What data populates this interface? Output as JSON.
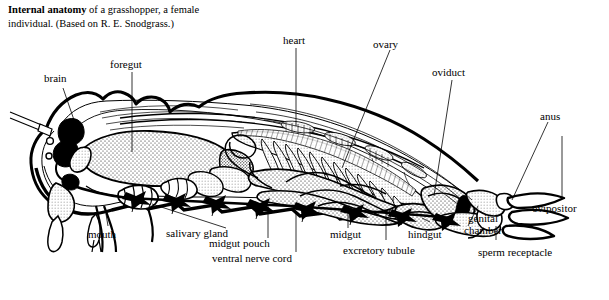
{
  "figure": {
    "caption_bold": "Internal anatomy",
    "caption_rest": " of a grasshopper, a female individual. (Based on R. E. Snodgrass.)",
    "background_color": "#ffffff",
    "ink_color": "#000000"
  },
  "labels": [
    {
      "id": "brain",
      "text": "brain"
    },
    {
      "id": "foregut",
      "text": "foregut"
    },
    {
      "id": "heart",
      "text": "heart"
    },
    {
      "id": "ovary",
      "text": "ovary"
    },
    {
      "id": "oviduct",
      "text": "oviduct"
    },
    {
      "id": "anus",
      "text": "anus"
    },
    {
      "id": "ovipositor",
      "text": "ovipositor"
    },
    {
      "id": "genital_chamber",
      "text": "genital chamber"
    },
    {
      "id": "sperm_receptacle",
      "text": "sperm receptacle"
    },
    {
      "id": "hindgut",
      "text": "hindgut"
    },
    {
      "id": "excretory_tubule",
      "text": "excretory tubule"
    },
    {
      "id": "midgut",
      "text": "midgut"
    },
    {
      "id": "ventral_nerve_cord",
      "text": "ventral nerve cord"
    },
    {
      "id": "midgut_pouch",
      "text": "midgut pouch"
    },
    {
      "id": "salivary_gland",
      "text": "salivary gland"
    },
    {
      "id": "mouth",
      "text": "mouth"
    }
  ]
}
